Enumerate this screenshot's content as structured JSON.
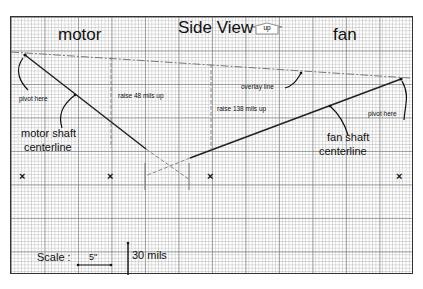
{
  "title": "Side View",
  "up_marker": "up",
  "sections": {
    "left": "motor",
    "right": "fan"
  },
  "annotations": {
    "motor_pivot": "pivot here",
    "fan_pivot": "pivot here",
    "motor_shaft": [
      "motor shaft",
      "centerline"
    ],
    "fan_shaft": [
      "fan shaft",
      "centerline"
    ],
    "overlay_line": "overlay line",
    "raise_motor": "raise 48 mils up",
    "raise_fan": "raise 138 mils up"
  },
  "scale": {
    "label": "Scale :",
    "horizontal": "5\"",
    "vertical": "30 mils"
  },
  "marks": [
    "×",
    "×",
    "×",
    "×"
  ],
  "colors": {
    "line": "#222222",
    "grid_major": "#8a8a8a",
    "grid_minor": "#bdbdbd",
    "dashed": "#888888"
  }
}
